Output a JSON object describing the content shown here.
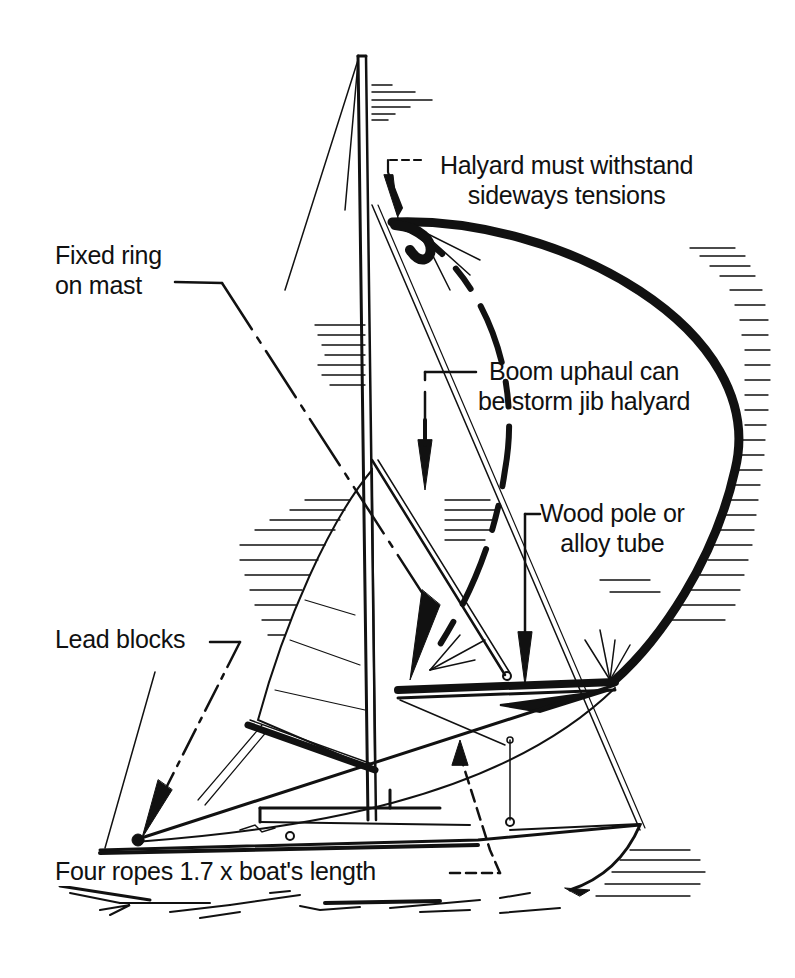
{
  "diagram": {
    "colors": {
      "ink": "#111111",
      "paper": "#ffffff"
    },
    "labels": {
      "halyard": {
        "line1": "Halyard  must  withstand",
        "line2": "sideways tensions"
      },
      "fixed_ring": {
        "line1": "Fixed  ring",
        "line2": "on  mast"
      },
      "boom_uphaul": {
        "line1": "Boom  uphaul can",
        "line2": "be  storm jib  halyard"
      },
      "wood_pole": {
        "line1": "Wood  pole or",
        "line2": "alloy  tube"
      },
      "lead_blocks": {
        "line1": "Lead  blocks"
      },
      "four_ropes": {
        "line1": "Four ropes  1.7  x  boat's length"
      }
    }
  }
}
